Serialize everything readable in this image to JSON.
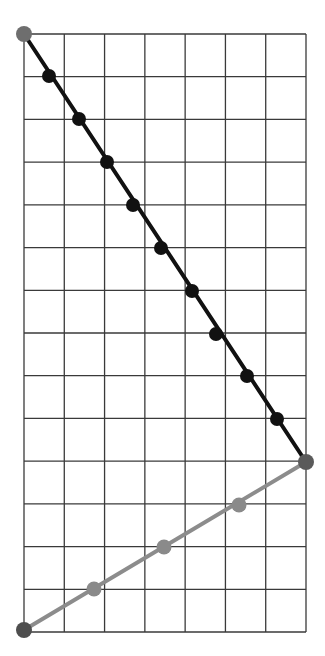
{
  "diagram": {
    "grid": {
      "left": 24,
      "top": 34,
      "right": 306,
      "bottom": 632,
      "columns": 7,
      "rows": 14,
      "line_color": "#3a3a3a",
      "line_width": 1.3
    },
    "segments": [
      {
        "name": "black-segment",
        "color": "#111111",
        "width": 4,
        "from": [
          24,
          34
        ],
        "to": [
          306,
          462
        ],
        "points": [
          [
            49,
            76
          ],
          [
            79,
            119
          ],
          [
            107,
            162
          ],
          [
            133,
            205
          ],
          [
            161,
            248
          ],
          [
            192,
            291
          ],
          [
            216,
            334
          ],
          [
            247,
            376
          ],
          [
            277,
            419
          ]
        ],
        "point_radius": 7,
        "point_color": "#111111"
      },
      {
        "name": "gray-segment",
        "color": "#8c8c8c",
        "width": 4,
        "from": [
          24,
          630
        ],
        "to": [
          306,
          462
        ],
        "points": [
          [
            94,
            589
          ],
          [
            164,
            547
          ],
          [
            239,
            505
          ]
        ],
        "point_radius": 7.5,
        "point_color": "#8a8a8a"
      }
    ],
    "endpoints": [
      {
        "name": "top-left-endpoint",
        "at": [
          24,
          34
        ],
        "r": 8,
        "color": "#6e6e6e"
      },
      {
        "name": "right-vertex-endpoint",
        "at": [
          306,
          462
        ],
        "r": 8,
        "color": "#5a5a5a"
      },
      {
        "name": "bottom-left-endpoint",
        "at": [
          24,
          630
        ],
        "r": 8,
        "color": "#4e4e4e"
      }
    ]
  }
}
